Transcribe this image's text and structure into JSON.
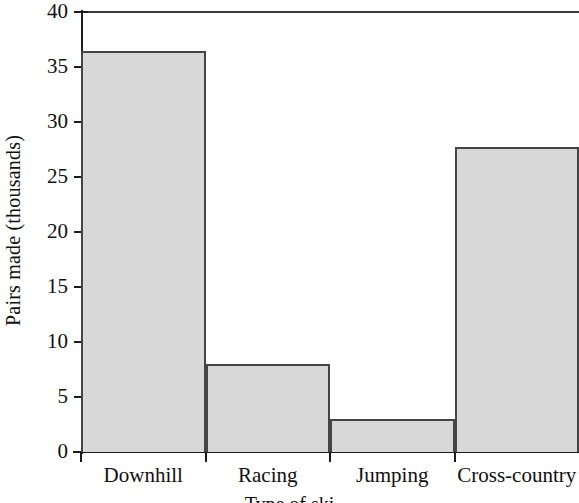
{
  "chart_data": {
    "type": "bar",
    "title": "",
    "subtitle": "",
    "xlabel": "Type of ski",
    "ylabel": "Pairs made (thousands)",
    "categories": [
      "Downhill",
      "Racing",
      "Jumping",
      "Cross-country"
    ],
    "values": [
      36.5,
      8,
      3,
      27.7
    ],
    "series": [
      {
        "name": "Pairs made",
        "values": [
          36.5,
          8,
          3,
          27.7
        ]
      }
    ],
    "ylim": [
      0,
      40
    ],
    "ytick_labels": [
      "0",
      "5",
      "10",
      "15",
      "20",
      "25",
      "30",
      "35",
      "40"
    ],
    "ytick_values": [
      0,
      5,
      10,
      15,
      20,
      25,
      30,
      35,
      40
    ],
    "grid": false,
    "legend": false,
    "legend_position": "none",
    "bar_fill_color": "#d8d8d8",
    "bar_border_color": "#454545",
    "axis_color": "#1c1c1c",
    "background_color": "#ffffff",
    "bars_touching": true
  }
}
